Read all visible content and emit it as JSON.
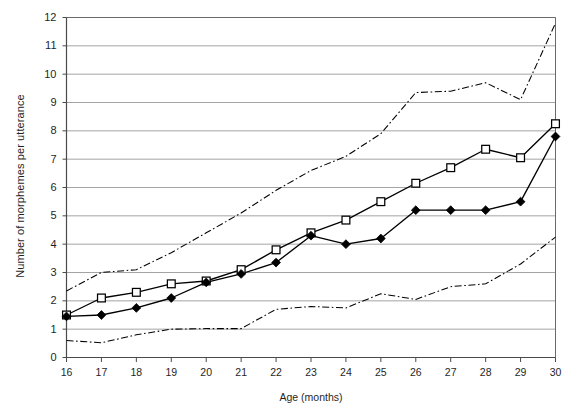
{
  "chart_data": {
    "type": "line",
    "title": "",
    "xlabel": "Age (months)",
    "ylabel": "Number of morphemes per utterance",
    "xlim": [
      16,
      30
    ],
    "ylim": [
      0,
      12
    ],
    "grid": true,
    "legend_position": "none",
    "xtick_labels": [
      "16",
      "17",
      "18",
      "19",
      "20",
      "21",
      "22",
      "23",
      "24",
      "25",
      "26",
      "27",
      "28",
      "29",
      "30"
    ],
    "ytick_labels": [
      "0",
      "1",
      "2",
      "3",
      "4",
      "5",
      "6",
      "7",
      "8",
      "9",
      "10",
      "11",
      "12"
    ],
    "x": [
      16,
      17,
      18,
      19,
      20,
      21,
      22,
      23,
      24,
      25,
      26,
      27,
      28,
      29,
      30
    ],
    "series": [
      {
        "name": "open-square-series",
        "marker": "open-square",
        "linestyle": "solid",
        "color": "#000000",
        "values": [
          1.5,
          2.1,
          2.3,
          2.6,
          2.7,
          3.1,
          3.8,
          4.4,
          4.85,
          5.5,
          6.15,
          6.7,
          7.35,
          7.05,
          8.25
        ]
      },
      {
        "name": "filled-diamond-series",
        "marker": "filled-diamond",
        "linestyle": "solid",
        "color": "#000000",
        "values": [
          1.45,
          1.5,
          1.75,
          2.1,
          2.65,
          2.95,
          3.35,
          4.3,
          4.0,
          4.2,
          5.2,
          5.2,
          5.2,
          5.5,
          7.8
        ]
      },
      {
        "name": "upper-confidence-band",
        "marker": "none",
        "linestyle": "dash-dot",
        "color": "#000000",
        "values": [
          2.35,
          3.0,
          3.1,
          3.7,
          4.4,
          5.1,
          5.9,
          6.6,
          7.1,
          7.9,
          9.35,
          9.4,
          9.7,
          9.1,
          11.8
        ]
      },
      {
        "name": "lower-confidence-band",
        "marker": "none",
        "linestyle": "dash-dot",
        "color": "#000000",
        "values": [
          0.6,
          0.52,
          0.8,
          1.0,
          1.02,
          1.02,
          1.7,
          1.8,
          1.75,
          2.25,
          2.05,
          2.5,
          2.6,
          3.3,
          4.25
        ]
      }
    ]
  }
}
